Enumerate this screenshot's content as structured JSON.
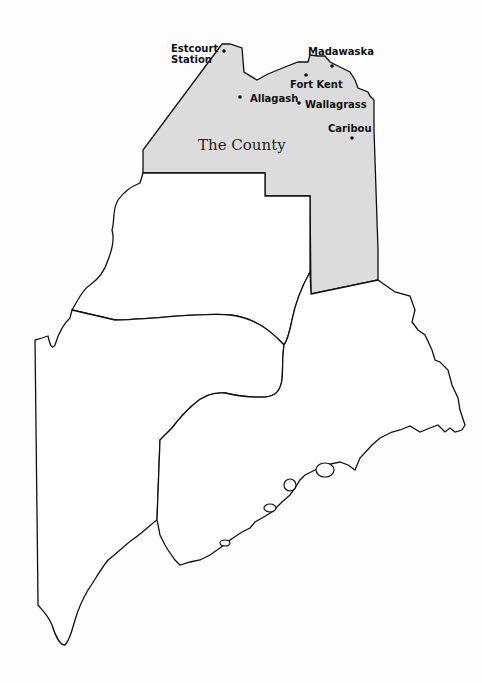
{
  "map": {
    "title": "Maine",
    "region_label": "The County",
    "colors": {
      "region_fill": "#dcdcdc",
      "outline": "#111111",
      "land": "#ffffff"
    },
    "places": [
      {
        "name": "Estcourt Station",
        "line1": "Estcourt",
        "line2": "Station"
      },
      {
        "name": "Madawaska"
      },
      {
        "name": "Fort Kent"
      },
      {
        "name": "Allagash"
      },
      {
        "name": "Wallagrass"
      },
      {
        "name": "Caribou"
      }
    ]
  }
}
